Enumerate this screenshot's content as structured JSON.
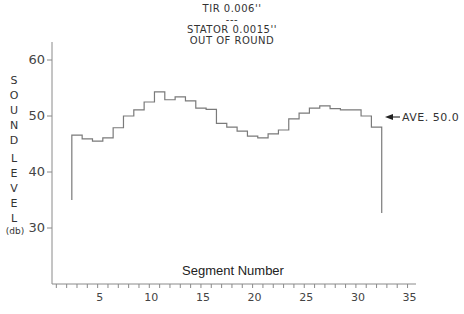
{
  "chart_data": {
    "type": "line",
    "style": "step",
    "title": [
      "TIR 0.006''",
      "---",
      "STATOR 0.0015''",
      "OUT OF ROUND"
    ],
    "xlabel": "Segment Number",
    "ylabel": "SOUND LEVEL (db)",
    "ylabel_letters": [
      "S",
      "O",
      "U",
      "N",
      "D",
      "",
      "L",
      "E",
      "V",
      "E",
      "L"
    ],
    "ylabel_unit": "(db)",
    "x_ticks": [
      5,
      10,
      15,
      20,
      25,
      30,
      35
    ],
    "y_ticks": [
      30,
      40,
      50,
      60
    ],
    "xlim": [
      0,
      35
    ],
    "ylim": [
      22,
      66
    ],
    "grid": false,
    "x": [
      3,
      4,
      5,
      6,
      7,
      8,
      9,
      10,
      11,
      12,
      13,
      14,
      15,
      16,
      17,
      18,
      19,
      20,
      21,
      22,
      23,
      24,
      25,
      26,
      27,
      28,
      29,
      30,
      31,
      32
    ],
    "series": [
      {
        "name": "Sound Level",
        "values": [
          46.6,
          45.9,
          45.5,
          46.1,
          47.9,
          50.0,
          51.1,
          52.5,
          54.3,
          52.9,
          53.4,
          52.7,
          51.4,
          51.2,
          48.7,
          48.0,
          47.3,
          46.4,
          46.1,
          46.8,
          47.5,
          49.5,
          50.5,
          51.4,
          51.8,
          51.3,
          51.1,
          51.1,
          50.0,
          48.0
        ],
        "start_drop_to": 35.0,
        "end_drop_to": 32.7
      }
    ],
    "annotations": [
      {
        "text": "AVE. 50.0",
        "value": 50.0,
        "arrow": "left"
      }
    ]
  }
}
